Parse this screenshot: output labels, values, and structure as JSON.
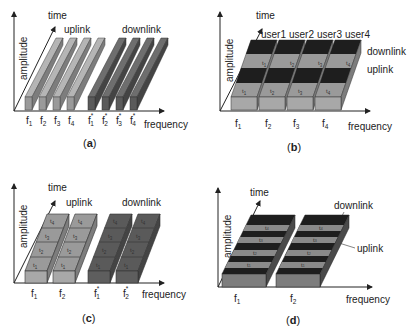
{
  "axes": {
    "amplitude": "amplitude",
    "time": "time",
    "frequency": "frequency"
  },
  "colors": {
    "light": "#9a9a9a",
    "light_top": "#b5b5b5",
    "light_side": "#7d7d7d",
    "dark": "#5a5a5a",
    "dark_top": "#6e6e6e",
    "dark_side": "#444444",
    "black": "#1e1e1e"
  },
  "panels": {
    "a": {
      "caption": "(a)",
      "caption_letter": "a",
      "uplink": "uplink",
      "downlink": "downlink",
      "freq_labels": [
        "f",
        "f",
        "f",
        "f",
        "f",
        "f",
        "f",
        "f"
      ],
      "freq_subs": [
        "1",
        "2",
        "3",
        "4",
        "1",
        "2",
        "3",
        "4"
      ],
      "freq_sup": "*"
    },
    "b": {
      "caption_letter": "b",
      "users": [
        "user1",
        "user2",
        "user3",
        "user4"
      ],
      "downlink": "downlink",
      "uplink": "uplink",
      "freq_subs": [
        "1",
        "2",
        "3",
        "4"
      ],
      "slot_subs": [
        "1",
        "2",
        "3",
        "4"
      ]
    },
    "c": {
      "caption_letter": "c",
      "uplink": "uplink",
      "downlink": "downlink",
      "freq_subs": [
        "1",
        "2",
        "1",
        "2"
      ],
      "slot_subs": [
        "1",
        "2",
        "3",
        "4"
      ]
    },
    "d": {
      "caption_letter": "d",
      "downlink": "downlink",
      "uplink": "uplink",
      "freq_subs": [
        "1",
        "2"
      ],
      "slot_subs": [
        "1",
        "2",
        "3",
        "4"
      ]
    }
  }
}
